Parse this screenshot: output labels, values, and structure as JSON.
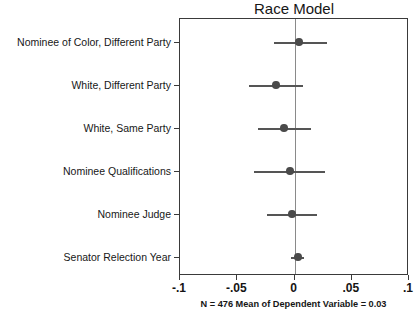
{
  "chart_data": {
    "type": "scatter",
    "title": "Race Model",
    "xlabel": "",
    "ylabel": "",
    "xlim": [
      -0.1,
      0.1
    ],
    "xticks": [
      -0.1,
      -0.05,
      0,
      0.05,
      0.1
    ],
    "xticklabels": [
      "-.1",
      "-.05",
      "0",
      ".05",
      ".1"
    ],
    "grid": false,
    "legend": null,
    "zero_reference_line": 0,
    "orientation": "horizontal",
    "categories": [
      "Nominee of Color, Different Party",
      "White, Different Party",
      "White, Same Party",
      "Nominee Qualifications",
      "Nominee Judge",
      "Senator Relection Year"
    ],
    "values": [
      0.004,
      -0.016,
      -0.009,
      -0.004,
      -0.002,
      0.003
    ],
    "ci_low": [
      -0.018,
      -0.04,
      -0.032,
      -0.035,
      -0.024,
      -0.003
    ],
    "ci_high": [
      0.028,
      0.007,
      0.014,
      0.027,
      0.02,
      0.008
    ],
    "points": [
      {
        "label": "Nominee of Color, Different Party",
        "estimate": 0.004,
        "ci_low": -0.018,
        "ci_high": 0.028
      },
      {
        "label": "White, Different Party",
        "estimate": -0.016,
        "ci_low": -0.04,
        "ci_high": 0.007
      },
      {
        "label": "White, Same Party",
        "estimate": -0.009,
        "ci_low": -0.032,
        "ci_high": 0.014
      },
      {
        "label": "Nominee Qualifications",
        "estimate": -0.004,
        "ci_low": -0.035,
        "ci_high": 0.027
      },
      {
        "label": "Nominee Judge",
        "estimate": -0.002,
        "ci_low": -0.024,
        "ci_high": 0.02
      },
      {
        "label": "Senator Relection Year",
        "estimate": 0.003,
        "ci_low": -0.003,
        "ci_high": 0.008
      }
    ],
    "annotations": [
      "N = 476 Mean of Dependent Variable = 0.03"
    ],
    "footnote": "N = 476 Mean of Dependent Variable = 0.03",
    "colors": {
      "point": "#4a4a4a",
      "ci": "#555555",
      "zero_line": "#8a8a8a",
      "frame": "#3a3a3a",
      "text": "#161616",
      "background": "#ffffff"
    }
  }
}
